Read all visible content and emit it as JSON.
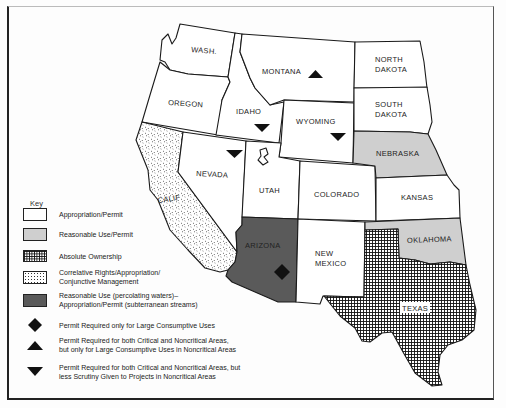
{
  "map": {
    "states": [
      {
        "id": "wa",
        "label": "WASH.",
        "category": "appropriation_permit"
      },
      {
        "id": "or",
        "label": "OREGON",
        "category": "appropriation_permit"
      },
      {
        "id": "ca",
        "label": "CALIF",
        "category": "correlative_rights"
      },
      {
        "id": "id",
        "label": "IDAHO",
        "category": "appropriation_permit",
        "symbol": "triangle-down"
      },
      {
        "id": "nv",
        "label": "NEVADA",
        "category": "appropriation_permit",
        "symbol": "triangle-down"
      },
      {
        "id": "mt",
        "label": "MONTANA",
        "category": "appropriation_permit",
        "symbol": "triangle-up"
      },
      {
        "id": "wy",
        "label": "WYOMING",
        "category": "appropriation_permit",
        "symbol": "triangle-down"
      },
      {
        "id": "ut",
        "label": "UTAH",
        "category": "appropriation_permit"
      },
      {
        "id": "co",
        "label": "COLORADO",
        "category": "appropriation_permit"
      },
      {
        "id": "az",
        "label": "ARIZONA",
        "category": "reasonable_use_percolating",
        "symbol": "diamond"
      },
      {
        "id": "nm",
        "label": "NEW MEXICO",
        "category": "appropriation_permit"
      },
      {
        "id": "nd",
        "label": "NORTH DAKOTA",
        "category": "appropriation_permit"
      },
      {
        "id": "sd",
        "label": "SOUTH DAKOTA",
        "category": "appropriation_permit"
      },
      {
        "id": "ne",
        "label": "NEBRASKA",
        "category": "reasonable_use_permit"
      },
      {
        "id": "ks",
        "label": "KANSAS",
        "category": "appropriation_permit"
      },
      {
        "id": "ok",
        "label": "OKLAHOMA",
        "category": "reasonable_use_permit"
      },
      {
        "id": "tx",
        "label": "TEXAS",
        "category": "absolute_ownership"
      }
    ],
    "labels": {
      "wa": "WASH.",
      "or": "OREGON",
      "ca": "CALIF",
      "id": "IDAHO",
      "nv": "NEVADA",
      "mt": "MONTANA",
      "wy": "WYOMING",
      "ut": "UTAH",
      "co": "COLORADO",
      "az": "ARIZONA",
      "nm1": "NEW",
      "nm2": "MEXICO",
      "nd1": "NORTH",
      "nd2": "DAKOTA",
      "sd1": "SOUTH",
      "sd2": "DAKOTA",
      "ne": "NEBRASKA",
      "ks": "KANSAS",
      "ok": "OKLAHOMA",
      "tx": "TEXAS"
    },
    "colors": {
      "appropriation_permit": "#ffffff",
      "reasonable_use_permit": "#cfcfcf",
      "reasonable_use_percolating": "#5a5a5a",
      "outline": "#1a1a1a"
    }
  },
  "key": {
    "title": "Key",
    "items": [
      {
        "swatch": "white",
        "label": "Appropriation/Permit"
      },
      {
        "swatch": "light-grey",
        "label": "Reasonable Use/Permit"
      },
      {
        "swatch": "crosshatch",
        "label": "Absolute Ownership"
      },
      {
        "swatch": "stipple",
        "label": "Correlative Rights/Appropriation/\nConjunctive Management"
      },
      {
        "swatch": "dark-grey",
        "label": "Reasonable Use (percolating waters)–\nAppropriation/Permit (subterranean streams)"
      }
    ],
    "symbols": [
      {
        "symbol": "diamond",
        "label": "Permit Required only for Large Consumptive Uses"
      },
      {
        "symbol": "triangle-up",
        "label": "Permit Required for both Critical and Noncritical Areas,\nbut only for Large Consumptive Uses in Noncritical Areas"
      },
      {
        "symbol": "triangle-down",
        "label": "Permit Required for both Critical and Noncritical Areas, but\nless Scrutiny Given to Projects in Noncritical Areas"
      }
    ]
  }
}
